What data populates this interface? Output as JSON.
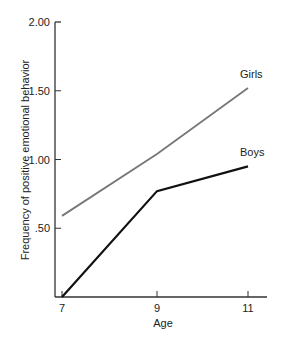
{
  "chart_data": {
    "type": "line",
    "title": "",
    "xlabel": "Age",
    "ylabel": "Frequency of positive emotional behavior",
    "x": [
      7,
      9,
      11
    ],
    "x_tick_labels": [
      "7",
      "9",
      "11"
    ],
    "y_tick_values": [
      0.5,
      1.0,
      1.5,
      2.0
    ],
    "y_tick_labels": [
      ".50",
      "1.00",
      "1.50",
      "2.00"
    ],
    "ylim": [
      0,
      2.0
    ],
    "xlim": [
      6.85,
      11.45
    ],
    "grid": false,
    "legend_position": "inline labels at line ends",
    "series": [
      {
        "name": "Girls",
        "values": [
          0.59,
          1.04,
          1.52
        ],
        "color": "#777777"
      },
      {
        "name": "Boys",
        "values": [
          0.0,
          0.77,
          0.95
        ],
        "color": "#111111"
      }
    ]
  }
}
